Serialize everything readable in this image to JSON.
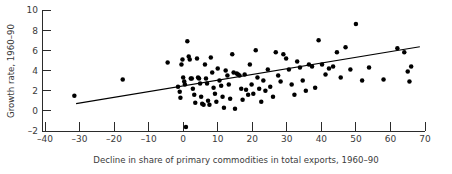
{
  "figure": {
    "background_color": "#ffffff",
    "marker_color": "#000000",
    "line_color": "#000000",
    "axis_color": "#2b2b2b"
  },
  "chart_data": {
    "type": "scatter",
    "title": "",
    "xlabel": "Decline in share of primary commodities in total exports, 1960–90",
    "ylabel": "Growth rate, 1960–90",
    "xlim": [
      -40,
      70
    ],
    "ylim": [
      -2,
      10
    ],
    "xticks": [
      -40,
      -30,
      -20,
      -10,
      0,
      10,
      20,
      30,
      40,
      50,
      60,
      70
    ],
    "yticks": [
      -2,
      0,
      2,
      4,
      6,
      8,
      10
    ],
    "xtick_labels": [
      "–40",
      "–30",
      "–20",
      "–10",
      "0",
      "10",
      "20",
      "30",
      "40",
      "50",
      "60",
      "70"
    ],
    "ytick_labels": [
      "–2",
      "0",
      "2",
      "4",
      "6",
      "8",
      "10"
    ],
    "grid": false,
    "legend": null,
    "series": [
      {
        "name": "countries",
        "type": "scatter",
        "marker": "filled-circle",
        "points": [
          [
            -31.5,
            1.5
          ],
          [
            -17.5,
            3.1
          ],
          [
            -4.5,
            4.8
          ],
          [
            -1.5,
            2.4
          ],
          [
            -1.0,
            1.9
          ],
          [
            -0.8,
            1.3
          ],
          [
            -0.5,
            4.6
          ],
          [
            -0.2,
            5.1
          ],
          [
            0.0,
            3.3
          ],
          [
            0.3,
            2.9
          ],
          [
            0.5,
            2.6
          ],
          [
            0.8,
            -1.6
          ],
          [
            1.2,
            6.9
          ],
          [
            1.6,
            5.4
          ],
          [
            1.9,
            5.1
          ],
          [
            2.2,
            3.2
          ],
          [
            2.5,
            3.2
          ],
          [
            2.8,
            2.2
          ],
          [
            3.2,
            1.6
          ],
          [
            3.5,
            0.8
          ],
          [
            4.0,
            5.2
          ],
          [
            4.3,
            3.3
          ],
          [
            4.6,
            3.2
          ],
          [
            4.9,
            2.7
          ],
          [
            5.2,
            1.4
          ],
          [
            5.5,
            0.7
          ],
          [
            5.9,
            0.6
          ],
          [
            6.3,
            4.6
          ],
          [
            6.6,
            3.2
          ],
          [
            6.9,
            2.7
          ],
          [
            7.2,
            1.0
          ],
          [
            7.6,
            0.6
          ],
          [
            8.0,
            5.3
          ],
          [
            8.4,
            3.8
          ],
          [
            8.8,
            2.3
          ],
          [
            9.2,
            1.7
          ],
          [
            9.6,
            0.9
          ],
          [
            10.0,
            4.2
          ],
          [
            10.5,
            3.0
          ],
          [
            11.0,
            2.5
          ],
          [
            11.4,
            1.4
          ],
          [
            11.8,
            0.3
          ],
          [
            12.3,
            4.0
          ],
          [
            12.8,
            3.5
          ],
          [
            13.2,
            2.6
          ],
          [
            13.6,
            1.2
          ],
          [
            14.2,
            5.6
          ],
          [
            14.6,
            3.8
          ],
          [
            15.0,
            0.2
          ],
          [
            15.5,
            3.7
          ],
          [
            15.9,
            3.6
          ],
          [
            16.3,
            3.5
          ],
          [
            16.8,
            2.2
          ],
          [
            17.2,
            1.1
          ],
          [
            17.8,
            3.6
          ],
          [
            18.2,
            2.1
          ],
          [
            18.8,
            1.6
          ],
          [
            19.3,
            4.6
          ],
          [
            19.8,
            2.6
          ],
          [
            20.3,
            1.7
          ],
          [
            21.0,
            6.0
          ],
          [
            21.5,
            3.3
          ],
          [
            22.0,
            2.2
          ],
          [
            22.6,
            0.9
          ],
          [
            23.2,
            3.0
          ],
          [
            23.8,
            2.0
          ],
          [
            24.5,
            4.1
          ],
          [
            25.2,
            2.4
          ],
          [
            26.0,
            1.4
          ],
          [
            26.8,
            5.8
          ],
          [
            27.5,
            3.5
          ],
          [
            28.2,
            2.9
          ],
          [
            29.0,
            5.6
          ],
          [
            29.8,
            5.2
          ],
          [
            30.6,
            4.1
          ],
          [
            31.4,
            2.6
          ],
          [
            32.2,
            1.6
          ],
          [
            33.0,
            4.9
          ],
          [
            33.8,
            4.3
          ],
          [
            34.6,
            3.0
          ],
          [
            35.5,
            2.0
          ],
          [
            36.4,
            4.6
          ],
          [
            37.3,
            4.4
          ],
          [
            38.2,
            2.3
          ],
          [
            39.2,
            7.0
          ],
          [
            40.2,
            4.6
          ],
          [
            41.2,
            3.6
          ],
          [
            42.2,
            4.2
          ],
          [
            43.4,
            4.4
          ],
          [
            44.5,
            5.8
          ],
          [
            45.6,
            3.3
          ],
          [
            47.0,
            6.3
          ],
          [
            48.4,
            4.1
          ],
          [
            50.0,
            8.6
          ],
          [
            51.8,
            3.0
          ],
          [
            53.8,
            4.3
          ],
          [
            58.0,
            3.1
          ],
          [
            62.0,
            6.2
          ],
          [
            64.0,
            5.8
          ],
          [
            65.0,
            3.9
          ],
          [
            65.5,
            2.9
          ],
          [
            66.0,
            4.4
          ]
        ]
      }
    ],
    "fit_line": {
      "name": "regression-line",
      "x_start": -31.0,
      "y_start": 0.72,
      "x_end": 68.5,
      "y_end": 6.35
    }
  }
}
